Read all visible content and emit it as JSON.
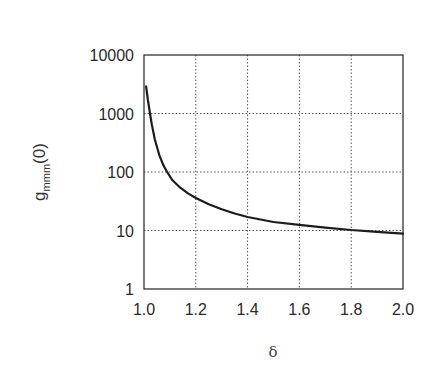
{
  "chart_data": {
    "type": "line",
    "title": "",
    "xlabel": "δ",
    "ylabel": "g_mmm(0)",
    "ylabel_main": "g",
    "ylabel_sub": "mmm",
    "ylabel_suffix": "(0)",
    "xscale": "linear",
    "yscale": "log",
    "xlim": [
      1.0,
      2.0
    ],
    "ylim": [
      1,
      10000
    ],
    "grid": true,
    "legend": null,
    "x_ticks": [
      "1.0",
      "1.2",
      "1.4",
      "1.6",
      "1.8",
      "2.0"
    ],
    "y_ticks": [
      "1",
      "10",
      "100",
      "1000",
      "10000"
    ],
    "series": [
      {
        "name": "g_mmm(0)",
        "x": [
          1.008,
          1.015,
          1.023,
          1.03,
          1.042,
          1.06,
          1.075,
          1.089,
          1.11,
          1.14,
          1.17,
          1.2,
          1.25,
          1.3,
          1.35,
          1.4,
          1.5,
          1.6,
          1.7,
          1.8,
          1.9,
          2.0
        ],
        "y": [
          2900,
          1700,
          1000,
          650,
          355,
          190,
          130,
          100,
          72,
          54,
          43,
          36,
          28,
          23,
          19.5,
          17,
          14,
          12.5,
          11.2,
          10.2,
          9.5,
          8.8
        ]
      }
    ]
  }
}
